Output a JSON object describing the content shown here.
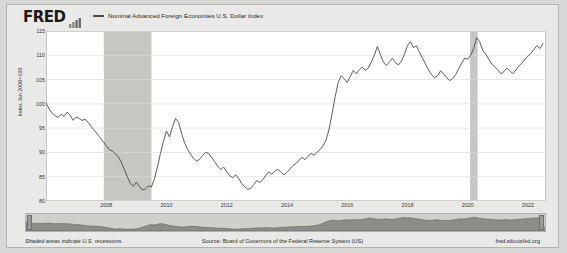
{
  "brand": {
    "logo_text": "FRED",
    "logo_mark": "bar-chart-mark"
  },
  "legend": {
    "series_label": "Nominal Advanced Foreign Economies U.S. Dollar Index",
    "swatch_color": "#4a4a4a"
  },
  "footer": {
    "note": "Shaded areas indicate U.S. recessions.",
    "source": "Source: Board of Governors of the Federal Reserve System (US)",
    "url": "fred.stlouisfed.org"
  },
  "navigator": {
    "left_handle": "range-start-handle",
    "right_handle": "range-end-handle"
  },
  "chart_data": {
    "type": "line",
    "title": "",
    "subtitle": "",
    "xlabel": "",
    "ylabel": "Index Jan 2006=100",
    "ylim": [
      80,
      115
    ],
    "yticks": [
      115,
      110,
      105,
      100,
      95,
      90,
      85,
      80
    ],
    "xlim": [
      2006.0,
      2022.6
    ],
    "xticks": [
      2008,
      2010,
      2012,
      2014,
      2016,
      2018,
      2020,
      2022
    ],
    "grid": "horizontal",
    "legend_position": "top",
    "line_color": "#4a4a4a",
    "line_width": 0.9,
    "plot_bg": "#ffffff",
    "recession_color": "#c6c6c3",
    "recessions": [
      {
        "start": 2007.92,
        "end": 2009.5
      },
      {
        "start": 2020.08,
        "end": 2020.33
      }
    ],
    "series": [
      {
        "name": "Nominal Advanced Foreign Economies U.S. Dollar Index",
        "x": [
          2006.0,
          2006.1,
          2006.2,
          2006.3,
          2006.4,
          2006.5,
          2006.6,
          2006.7,
          2006.8,
          2006.9,
          2007.0,
          2007.1,
          2007.2,
          2007.3,
          2007.4,
          2007.5,
          2007.6,
          2007.7,
          2007.8,
          2007.9,
          2008.0,
          2008.1,
          2008.2,
          2008.3,
          2008.4,
          2008.5,
          2008.6,
          2008.7,
          2008.8,
          2008.9,
          2009.0,
          2009.1,
          2009.2,
          2009.3,
          2009.4,
          2009.5,
          2009.6,
          2009.7,
          2009.8,
          2009.9,
          2010.0,
          2010.1,
          2010.2,
          2010.3,
          2010.4,
          2010.5,
          2010.6,
          2010.7,
          2010.8,
          2010.9,
          2011.0,
          2011.1,
          2011.2,
          2011.3,
          2011.4,
          2011.5,
          2011.6,
          2011.7,
          2011.8,
          2011.9,
          2012.0,
          2012.1,
          2012.2,
          2012.3,
          2012.4,
          2012.5,
          2012.6,
          2012.7,
          2012.8,
          2012.9,
          2013.0,
          2013.1,
          2013.2,
          2013.3,
          2013.4,
          2013.5,
          2013.6,
          2013.7,
          2013.8,
          2013.9,
          2014.0,
          2014.1,
          2014.2,
          2014.3,
          2014.4,
          2014.5,
          2014.6,
          2014.7,
          2014.8,
          2014.9,
          2015.0,
          2015.1,
          2015.2,
          2015.3,
          2015.4,
          2015.5,
          2015.6,
          2015.7,
          2015.8,
          2015.9,
          2016.0,
          2016.1,
          2016.2,
          2016.3,
          2016.4,
          2016.5,
          2016.6,
          2016.7,
          2016.8,
          2016.9,
          2017.0,
          2017.1,
          2017.2,
          2017.3,
          2017.4,
          2017.5,
          2017.6,
          2017.7,
          2017.8,
          2017.9,
          2018.0,
          2018.1,
          2018.2,
          2018.3,
          2018.4,
          2018.5,
          2018.6,
          2018.7,
          2018.8,
          2018.9,
          2019.0,
          2019.1,
          2019.2,
          2019.3,
          2019.4,
          2019.5,
          2019.6,
          2019.7,
          2019.8,
          2019.9,
          2020.0,
          2020.1,
          2020.2,
          2020.3,
          2020.4,
          2020.5,
          2020.6,
          2020.7,
          2020.8,
          2020.9,
          2021.0,
          2021.1,
          2021.2,
          2021.3,
          2021.4,
          2021.5,
          2021.6,
          2021.7,
          2021.8,
          2021.9,
          2022.0,
          2022.1,
          2022.2,
          2022.3,
          2022.4,
          2022.5
        ],
        "y": [
          100.2,
          99.0,
          98.1,
          97.6,
          97.2,
          97.9,
          97.4,
          98.3,
          97.7,
          96.6,
          97.3,
          97.0,
          96.6,
          96.8,
          96.2,
          95.3,
          94.6,
          93.8,
          93.0,
          92.2,
          91.4,
          90.6,
          90.3,
          89.8,
          89.1,
          88.0,
          86.5,
          85.0,
          83.6,
          83.0,
          83.9,
          83.0,
          82.3,
          82.5,
          83.1,
          82.9,
          84.6,
          87.0,
          89.8,
          92.3,
          94.4,
          93.2,
          95.3,
          97.0,
          96.2,
          94.0,
          92.0,
          90.6,
          89.6,
          88.8,
          88.2,
          88.6,
          89.4,
          90.0,
          89.8,
          89.0,
          88.1,
          87.2,
          86.5,
          87.0,
          86.0,
          85.2,
          84.8,
          85.4,
          84.6,
          83.6,
          82.9,
          82.4,
          82.6,
          83.4,
          84.2,
          83.8,
          84.4,
          85.3,
          86.0,
          85.5,
          86.2,
          86.5,
          86.0,
          85.4,
          85.9,
          86.6,
          87.3,
          87.7,
          88.4,
          89.0,
          88.5,
          89.2,
          89.8,
          89.4,
          90.0,
          90.6,
          91.4,
          92.6,
          94.8,
          98.0,
          101.5,
          104.4,
          105.8,
          105.2,
          104.4,
          105.6,
          106.9,
          106.2,
          107.0,
          107.6,
          106.9,
          107.4,
          108.6,
          110.0,
          111.8,
          110.2,
          108.6,
          107.9,
          108.6,
          109.4,
          108.5,
          108.0,
          108.8,
          110.2,
          112.0,
          112.8,
          111.6,
          111.9,
          110.6,
          109.4,
          108.2,
          107.0,
          106.0,
          105.4,
          105.8,
          106.8,
          106.2,
          105.4,
          104.8,
          105.2,
          106.0,
          107.2,
          108.4,
          109.4,
          109.2,
          110.0,
          111.4,
          113.6,
          112.8,
          111.0,
          110.2,
          109.2,
          108.2,
          107.6,
          107.0,
          106.2,
          106.6,
          107.4,
          106.8,
          106.2,
          107.0,
          107.8,
          108.4,
          109.2,
          109.8,
          110.4,
          111.2,
          112.0,
          111.4,
          112.4
        ]
      }
    ]
  }
}
